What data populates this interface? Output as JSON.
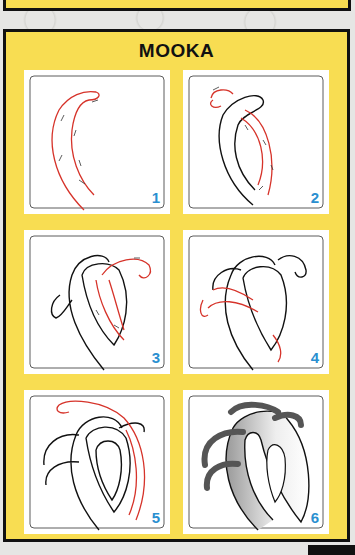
{
  "title": "MOOKA",
  "colors": {
    "panel_yellow": "#f8dd52",
    "frame_black": "#111111",
    "guide_red": "#d6332a",
    "step_number_blue": "#2a8fd0"
  },
  "steps": [
    {
      "number": "1"
    },
    {
      "number": "2"
    },
    {
      "number": "3"
    },
    {
      "number": "4"
    },
    {
      "number": "5"
    },
    {
      "number": "6"
    }
  ]
}
